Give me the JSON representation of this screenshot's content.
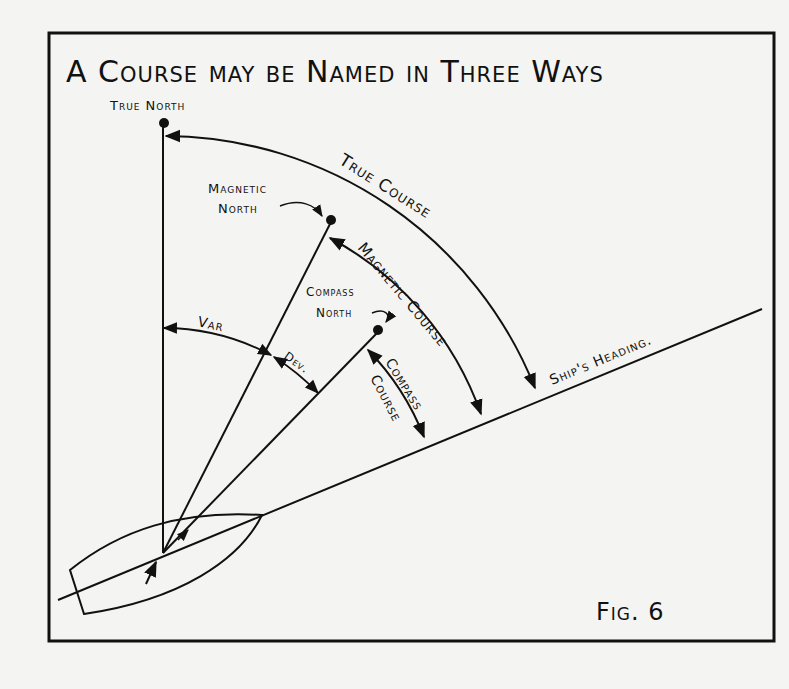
{
  "title": "A Course may be Named in Three Ways",
  "figure_label": "Fig. 6",
  "colors": {
    "ink": "#111111",
    "paper": "#f4f4f2"
  },
  "labels": {
    "true_north": "True North",
    "magnetic_north_1": "Magnetic",
    "magnetic_north_2": "North",
    "compass_north_1": "Compass",
    "compass_north_2": "North",
    "true_course": "True Course",
    "magnetic_course": "Magnetic Course",
    "compass_course_1": "Compass",
    "compass_course_2": "Course",
    "variation": "Var",
    "deviation": "Dev.",
    "ships_heading": "Ship's Heading."
  }
}
